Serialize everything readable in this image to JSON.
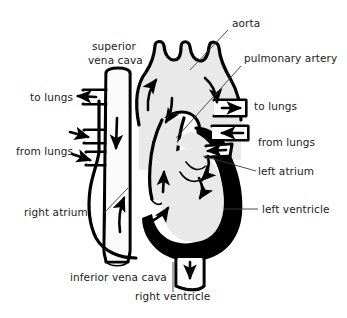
{
  "diagram": {
    "style": "line-drawing",
    "background_color": "#ffffff",
    "wall_color": "#000000",
    "lumen_color": "#e9e9e9",
    "label_color": "#1b1b1b",
    "labels": [
      {
        "id": "aorta",
        "text": "aorta",
        "x": 232,
        "y": 27,
        "anchor": "start"
      },
      {
        "id": "pulmonary-artery",
        "text": "pulmonary artery",
        "x": 244,
        "y": 62,
        "anchor": "start"
      },
      {
        "id": "superior-vena-cava-1",
        "text": "superior",
        "x": 92,
        "y": 50,
        "anchor": "start"
      },
      {
        "id": "superior-vena-cava-2",
        "text": "vena cava",
        "x": 88,
        "y": 64,
        "anchor": "start"
      },
      {
        "id": "to-lungs-left",
        "text": "to lungs",
        "x": 30,
        "y": 101,
        "anchor": "start"
      },
      {
        "id": "to-lungs-right",
        "text": "to lungs",
        "x": 254,
        "y": 110,
        "anchor": "start"
      },
      {
        "id": "from-lungs-left",
        "text": "from lungs",
        "x": 16,
        "y": 155,
        "anchor": "start"
      },
      {
        "id": "from-lungs-right",
        "text": "from lungs",
        "x": 258,
        "y": 146,
        "anchor": "start"
      },
      {
        "id": "left-atrium",
        "text": "left atrium",
        "x": 258,
        "y": 175,
        "anchor": "start"
      },
      {
        "id": "right-atrium",
        "text": "right atrium",
        "x": 24,
        "y": 216,
        "anchor": "start"
      },
      {
        "id": "left-ventricle",
        "text": "left ventricle",
        "x": 262,
        "y": 213,
        "anchor": "start"
      },
      {
        "id": "inferior-vena-cava",
        "text": "inferior vena cava",
        "x": 70,
        "y": 281,
        "anchor": "start"
      },
      {
        "id": "right-ventricle",
        "text": "right ventricle",
        "x": 135,
        "y": 300,
        "anchor": "start"
      }
    ],
    "flow_arrows": [
      {
        "id": "svc-inflow-to-lungs",
        "direction": "left",
        "vessel": "to lungs (upper left)"
      },
      {
        "id": "pulmonary-vein-inflow-1",
        "direction": "right",
        "vessel": "from lungs (left upper)"
      },
      {
        "id": "pulmonary-vein-inflow-2",
        "direction": "right",
        "vessel": "from lungs (left lower)"
      },
      {
        "id": "svc-descending",
        "direction": "down",
        "vessel": "superior vena cava"
      },
      {
        "id": "right-atrium-inflow",
        "direction": "up",
        "vessel": "right atrium"
      },
      {
        "id": "right-ventricle-outflow",
        "direction": "up",
        "vessel": "right ventricle to pulmonary artery"
      },
      {
        "id": "aortic-arch-ascending",
        "direction": "up",
        "vessel": "ascending aorta"
      },
      {
        "id": "aortic-arch-descending",
        "direction": "down",
        "vessel": "descending aorta"
      },
      {
        "id": "to-lungs-outflow",
        "direction": "right",
        "vessel": "to lungs (right)"
      },
      {
        "id": "from-lungs-inflow",
        "direction": "left",
        "vessel": "from lungs (right)"
      },
      {
        "id": "left-atrium-to-ventricle",
        "direction": "down",
        "vessel": "left atrium to left ventricle"
      },
      {
        "id": "descending-aorta-down",
        "direction": "down",
        "vessel": "descending aorta outlet"
      }
    ]
  }
}
